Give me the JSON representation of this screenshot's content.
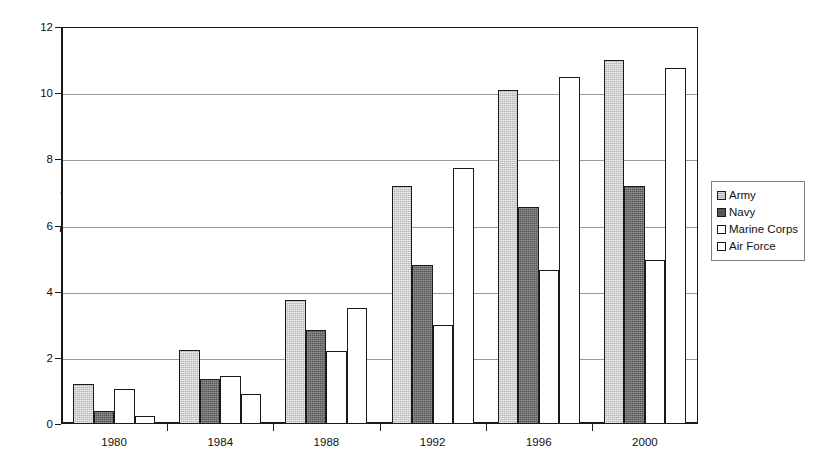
{
  "chart_data": {
    "type": "bar",
    "title": "",
    "subtitle": "",
    "xlabel": "",
    "ylabel": "Percentage",
    "categories": [
      "1980",
      "1984",
      "1988",
      "1992",
      "1996",
      "2000"
    ],
    "series": [
      {
        "name": "Army",
        "color": "#b5b5b5",
        "values": [
          1.2,
          2.25,
          3.75,
          7.2,
          10.1,
          11.0
        ]
      },
      {
        "name": "Navy",
        "color": "#575757",
        "values": [
          0.4,
          1.35,
          2.85,
          4.8,
          6.55,
          7.2
        ]
      },
      {
        "name": "Marine Corps",
        "color": "#ffffff",
        "values": [
          1.05,
          1.45,
          2.2,
          3.0,
          4.65,
          4.95
        ]
      },
      {
        "name": "Air Force",
        "color": "#ffffff",
        "values": [
          0.25,
          0.9,
          3.5,
          7.75,
          10.5,
          10.75
        ]
      }
    ],
    "ylim": [
      0,
      12
    ],
    "yticks": [
      0,
      2,
      4,
      6,
      8,
      10,
      12
    ],
    "ytick_labels": [
      "0",
      "2",
      "4",
      "6",
      "8",
      "10",
      "12"
    ],
    "grid": true,
    "grid_axis": "y",
    "legend_position": "right",
    "legend_entries": [
      "Army",
      "Navy",
      "Marine Corps",
      "Air Force"
    ]
  },
  "axes": {
    "y_title": "Percentage"
  },
  "caption": {
    "remnant": ""
  }
}
